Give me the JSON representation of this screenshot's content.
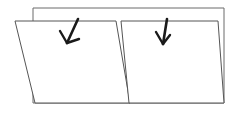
{
  "figure": {
    "title": "Two overlapping slanted panels with downward arrows",
    "canvas": {
      "width": 241,
      "height": 115,
      "background": "#ffffff"
    },
    "colors": {
      "panel_stroke": "#555555",
      "back_panel_stroke": "#6a6a6a",
      "arrow_stroke": "#1a1a1a",
      "panel_fill": "#ffffff"
    },
    "shapes": {
      "back_panel": {
        "label": "back rectangle",
        "points": "33,8 224,8 224,103 33,103"
      },
      "left_panel": {
        "label": "left slanted panel",
        "points": "15,21 116,21 130,103 35,103"
      },
      "right_panel": {
        "label": "right slanted panel",
        "points": "121,21 218,21 224,103 129,103"
      }
    },
    "arrows": [
      {
        "name": "left-down-arrow",
        "shaft": "M 78,19 L 67,43",
        "head_left": "M 67,43 L 60,31",
        "head_right": "M 67,43 L 79,39"
      },
      {
        "name": "right-down-arrow",
        "shaft": "M 167,19 L 163,44",
        "head_left": "M 163,44 L 156,32",
        "head_right": "M 163,44 L 170,35"
      }
    ]
  }
}
